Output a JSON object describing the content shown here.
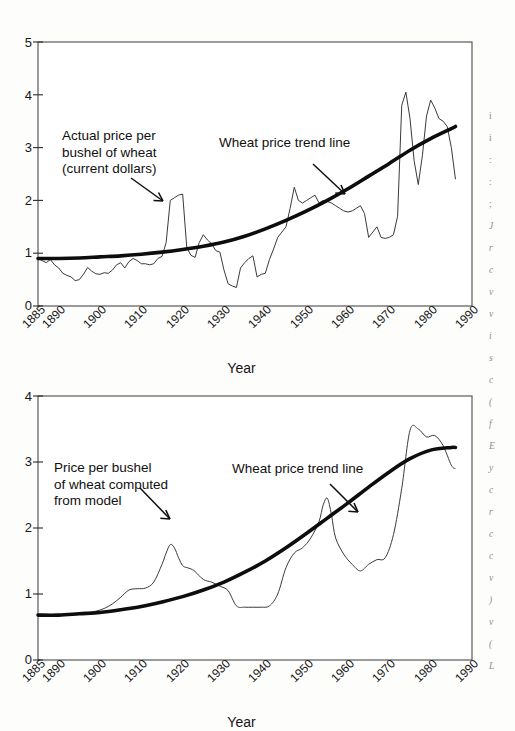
{
  "page": {
    "background_color": "#fdfdfc",
    "ink_color": "#161616"
  },
  "charts": {
    "top": {
      "axis_title_x": "Year",
      "annotation_series": "Actual price per\nbushel of wheat\n(current dollars)",
      "annotation_trend": "Wheat price trend line",
      "y_ticks": [
        "0",
        "1",
        "2",
        "3",
        "4",
        "5"
      ],
      "x_ticks": [
        "1885",
        "1890",
        "1900",
        "1910",
        "1920",
        "1930",
        "1940",
        "1950",
        "1960",
        "1970",
        "1980",
        "1990"
      ]
    },
    "bottom": {
      "axis_title_x": "Year",
      "annotation_series": "Price per bushel\nof wheat computed\nfrom model",
      "annotation_trend": "Wheat price trend line",
      "y_ticks": [
        "0",
        "1",
        "2",
        "3",
        "4"
      ],
      "x_ticks": [
        "1885",
        "1890",
        "1900",
        "1910",
        "1920",
        "1930",
        "1940",
        "1950",
        "1960",
        "1970",
        "1980",
        "1990"
      ]
    }
  },
  "chart_data": [
    {
      "id": "actual-wheat-price",
      "type": "line",
      "title": "",
      "xlabel": "Year",
      "ylabel": "",
      "xlim": [
        1885,
        1990
      ],
      "ylim": [
        0,
        5
      ],
      "grid": false,
      "legend": "none",
      "xticks": [
        1885,
        1890,
        1900,
        1910,
        1920,
        1930,
        1940,
        1950,
        1960,
        1970,
        1980,
        1990
      ],
      "yticks": [
        0,
        1,
        2,
        3,
        4,
        5
      ],
      "annotations": [
        {
          "text": "Actual price per bushel of wheat (current dollars)",
          "points_to_year": 1916,
          "points_to_value": 2.1
        },
        {
          "text": "Wheat price trend line",
          "points_to_year": 1966,
          "points_to_value": 2.2
        }
      ],
      "series": [
        {
          "name": "Actual price per bushel of wheat (current dollars)",
          "style": "thin-jagged",
          "x": [
            1885,
            1886,
            1887,
            1888,
            1889,
            1890,
            1891,
            1892,
            1893,
            1894,
            1895,
            1896,
            1897,
            1898,
            1899,
            1900,
            1901,
            1902,
            1903,
            1904,
            1905,
            1906,
            1907,
            1908,
            1909,
            1910,
            1911,
            1912,
            1913,
            1914,
            1915,
            1916,
            1917,
            1918,
            1919,
            1920,
            1921,
            1922,
            1923,
            1924,
            1925,
            1926,
            1927,
            1928,
            1929,
            1930,
            1931,
            1932,
            1933,
            1934,
            1935,
            1936,
            1937,
            1938,
            1939,
            1940,
            1941,
            1942,
            1943,
            1944,
            1945,
            1946,
            1947,
            1948,
            1949,
            1950,
            1951,
            1952,
            1953,
            1954,
            1955,
            1956,
            1957,
            1958,
            1959,
            1960,
            1961,
            1962,
            1963,
            1964,
            1965,
            1966,
            1967,
            1968,
            1969,
            1970,
            1971,
            1972,
            1973,
            1974,
            1975,
            1976,
            1977,
            1978,
            1979,
            1980,
            1981,
            1982,
            1983,
            1984,
            1985,
            1986
          ],
          "y": [
            0.9,
            0.86,
            0.82,
            0.88,
            0.78,
            0.72,
            0.62,
            0.58,
            0.55,
            0.48,
            0.5,
            0.6,
            0.73,
            0.66,
            0.61,
            0.6,
            0.63,
            0.62,
            0.68,
            0.78,
            0.82,
            0.72,
            0.84,
            0.9,
            0.86,
            0.8,
            0.8,
            0.78,
            0.8,
            0.9,
            0.94,
            1.2,
            2.0,
            2.05,
            2.1,
            2.12,
            1.1,
            0.96,
            0.92,
            1.2,
            1.35,
            1.25,
            1.18,
            1.05,
            1.02,
            0.68,
            0.42,
            0.38,
            0.35,
            0.72,
            0.82,
            0.9,
            0.95,
            0.55,
            0.6,
            0.62,
            0.88,
            1.08,
            1.3,
            1.4,
            1.5,
            1.85,
            2.25,
            2.0,
            1.95,
            2.0,
            2.05,
            2.1,
            1.95,
            2.0,
            1.98,
            1.95,
            1.9,
            1.85,
            1.8,
            1.78,
            1.8,
            1.85,
            1.9,
            1.75,
            1.3,
            1.4,
            1.5,
            1.3,
            1.28,
            1.3,
            1.35,
            1.7,
            3.8,
            4.05,
            3.55,
            2.75,
            2.3,
            2.85,
            3.6,
            3.9,
            3.75,
            3.55,
            3.5,
            3.4,
            3.0,
            2.4
          ]
        },
        {
          "name": "Wheat price trend line",
          "style": "thick-smooth",
          "x": [
            1885,
            1890,
            1895,
            1900,
            1905,
            1910,
            1915,
            1920,
            1925,
            1930,
            1935,
            1940,
            1945,
            1950,
            1955,
            1960,
            1965,
            1970,
            1975,
            1980,
            1985,
            1986
          ],
          "y": [
            0.9,
            0.9,
            0.91,
            0.93,
            0.95,
            0.98,
            1.02,
            1.07,
            1.13,
            1.21,
            1.32,
            1.46,
            1.62,
            1.8,
            2.0,
            2.22,
            2.46,
            2.7,
            2.95,
            3.17,
            3.36,
            3.4
          ]
        }
      ]
    },
    {
      "id": "model-wheat-price",
      "type": "line",
      "title": "",
      "xlabel": "Year",
      "ylabel": "",
      "xlim": [
        1885,
        1990
      ],
      "ylim": [
        0,
        4
      ],
      "grid": false,
      "legend": "none",
      "xticks": [
        1885,
        1890,
        1900,
        1910,
        1920,
        1930,
        1940,
        1950,
        1960,
        1970,
        1980,
        1990
      ],
      "yticks": [
        0,
        1,
        2,
        3,
        4
      ],
      "annotations": [
        {
          "text": "Price per bushel of wheat computed from model",
          "points_to_year": 1916,
          "points_to_value": 1.7
        },
        {
          "text": "Wheat price trend line",
          "points_to_year": 1963,
          "points_to_value": 2.05
        }
      ],
      "series": [
        {
          "name": "Price per bushel of wheat computed from model",
          "style": "thin-smooth",
          "x": [
            1885,
            1887,
            1889,
            1891,
            1893,
            1895,
            1897,
            1899,
            1901,
            1903,
            1905,
            1907,
            1909,
            1911,
            1913,
            1915,
            1916,
            1917,
            1918,
            1919,
            1920,
            1921,
            1922,
            1923,
            1925,
            1927,
            1929,
            1931,
            1933,
            1935,
            1937,
            1939,
            1941,
            1943,
            1945,
            1947,
            1949,
            1951,
            1953,
            1954,
            1955,
            1956,
            1957,
            1959,
            1961,
            1963,
            1965,
            1967,
            1969,
            1971,
            1973,
            1975,
            1977,
            1979,
            1981,
            1983,
            1985,
            1986
          ],
          "y": [
            0.68,
            0.68,
            0.69,
            0.69,
            0.7,
            0.71,
            0.72,
            0.74,
            0.78,
            0.85,
            0.95,
            1.06,
            1.08,
            1.09,
            1.18,
            1.45,
            1.62,
            1.75,
            1.7,
            1.55,
            1.43,
            1.4,
            1.38,
            1.34,
            1.22,
            1.18,
            1.12,
            1.05,
            0.82,
            0.8,
            0.8,
            0.8,
            0.82,
            1.0,
            1.4,
            1.62,
            1.7,
            1.85,
            2.1,
            2.35,
            2.45,
            2.2,
            1.85,
            1.6,
            1.45,
            1.35,
            1.45,
            1.52,
            1.55,
            1.9,
            2.6,
            3.48,
            3.5,
            3.38,
            3.4,
            3.25,
            2.95,
            2.9
          ]
        },
        {
          "name": "Wheat price trend line",
          "style": "thick-smooth",
          "x": [
            1885,
            1890,
            1895,
            1900,
            1905,
            1910,
            1915,
            1920,
            1925,
            1930,
            1935,
            1940,
            1945,
            1950,
            1955,
            1960,
            1965,
            1970,
            1975,
            1980,
            1985,
            1986
          ],
          "y": [
            0.68,
            0.68,
            0.7,
            0.72,
            0.76,
            0.81,
            0.88,
            0.96,
            1.06,
            1.18,
            1.33,
            1.5,
            1.7,
            1.92,
            2.15,
            2.38,
            2.62,
            2.85,
            3.05,
            3.18,
            3.22,
            3.22
          ]
        }
      ]
    }
  ],
  "margin_text": {
    "note": "Partially cut-off body text at right page edge",
    "lines": [
      "i",
      "i",
      ":",
      ":",
      ";",
      "J",
      "r",
      "c",
      "v",
      "v",
      "i",
      "s",
      "c",
      "(",
      "f",
      "E",
      "y",
      "c",
      "r",
      "c",
      "c",
      "v",
      ")",
      "v",
      "(",
      "L"
    ]
  }
}
